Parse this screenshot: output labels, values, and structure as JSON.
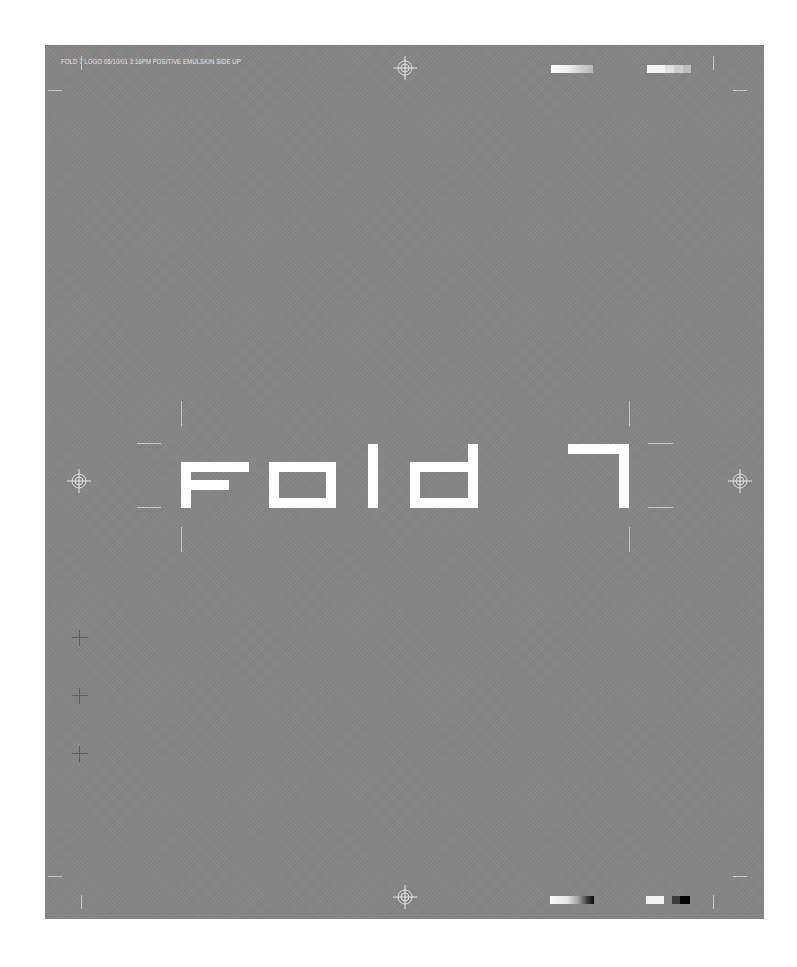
{
  "slug_line": "FOLD 7 LOGO 05/10/01  3:16PM  POSITIVE EMULSKIN SIDE UP",
  "logo": {
    "text": "Fold 7",
    "color": "#ffffff"
  },
  "colors": {
    "sheet_background": "#858585",
    "page_background": "#ffffff",
    "hairline": "#c7c7c7",
    "glyph": "#ffffff"
  },
  "marks": {
    "registration_targets": [
      "top-center",
      "left-middle",
      "right-middle",
      "bottom-center"
    ],
    "top_color_bars": [
      "gradient-white-to-gray",
      "gray-step-wedge"
    ],
    "bottom_color_bars": [
      "gradient-white-to-black",
      "step-wedge-white-gray-black"
    ],
    "left_crosshairs": 3
  }
}
